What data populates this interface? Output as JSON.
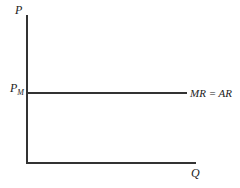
{
  "diagram": {
    "y_axis_label": "P",
    "x_axis_label": "Q",
    "price_level_label": "P",
    "price_level_subscript": "M",
    "curve_label": "MR = AR",
    "line_color": "#333333"
  }
}
